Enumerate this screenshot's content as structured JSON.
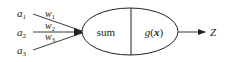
{
  "diagram": {
    "inputs": [
      {
        "label": "a",
        "sub": "1"
      },
      {
        "label": "a",
        "sub": "2"
      },
      {
        "label": "a",
        "sub": "3"
      }
    ],
    "weights": [
      {
        "label": "w",
        "sub": "1"
      },
      {
        "label": "w",
        "sub": "2"
      },
      {
        "label": "w",
        "sub": "3"
      }
    ],
    "node": {
      "left_label": "sum",
      "right_label": "g(x)",
      "right_label_parts": {
        "g": "g",
        "open": "(",
        "x": "x",
        "close": ")"
      }
    },
    "output": {
      "label": "Z"
    },
    "colors": {
      "stroke": "#222222",
      "background": "#ffffff"
    }
  }
}
